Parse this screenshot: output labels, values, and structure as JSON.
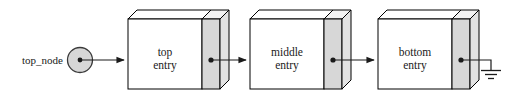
{
  "diagram": {
    "background_color": "#ffffff",
    "line_color": "#1a1a1a",
    "box_fill": "#ffffff",
    "pointer_fill": "#d7d7d7",
    "side_fill": "#e3e3e3",
    "head": {
      "label": "top_node",
      "shape": "circle",
      "fill": "#d7d7d7",
      "has_pointer_dot": true
    },
    "nodes": [
      {
        "id": "node-top",
        "line1": "top",
        "line2": "entry",
        "has_pointer_dot": true
      },
      {
        "id": "node-middle",
        "line1": "middle",
        "line2": "entry",
        "has_pointer_dot": true
      },
      {
        "id": "node-bottom",
        "line1": "bottom",
        "line2": "entry",
        "has_pointer_dot": true
      }
    ],
    "links": [
      {
        "from": "top_node",
        "to": "node-top",
        "style": "arrow"
      },
      {
        "from": "node-top",
        "to": "node-middle",
        "style": "arrow"
      },
      {
        "from": "node-middle",
        "to": "node-bottom",
        "style": "arrow"
      },
      {
        "from": "node-bottom",
        "to": "ground",
        "style": "ground"
      }
    ],
    "terminator": {
      "id": "ground",
      "symbol": "ground-symbol",
      "bars": 3
    }
  }
}
